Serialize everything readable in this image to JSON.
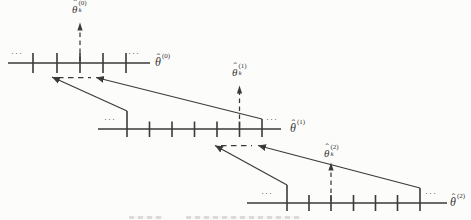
{
  "figure": {
    "type": "multi-resolution zoom-in quantization diagram",
    "ellipsis": "···",
    "levels": [
      {
        "name": "level-0",
        "tick_count": 5,
        "axis_label": {
          "hat": "ˆ",
          "base": "θ",
          "sup": "(0)"
        },
        "arrow_label": {
          "hat": "ˆ",
          "base": "θ",
          "sub": "k",
          "sup": "(0)"
        }
      },
      {
        "name": "level-1",
        "tick_count": 7,
        "axis_label": {
          "hat": "ˆ",
          "base": "θ",
          "sup": "(1)"
        },
        "arrow_label": {
          "hat": "ˆ",
          "base": "θ",
          "sub": "k",
          "sup": "(1)"
        }
      },
      {
        "name": "level-2",
        "tick_count": 7,
        "axis_label": {
          "hat": "ˆ",
          "base": "θ",
          "sup": "(2)"
        },
        "arrow_label": {
          "hat": "ˆ",
          "base": "θ",
          "sub": "k",
          "sup": "(2)"
        }
      }
    ],
    "stroke_color": "#3a3a3a",
    "background_color": "#fcfcfb"
  }
}
